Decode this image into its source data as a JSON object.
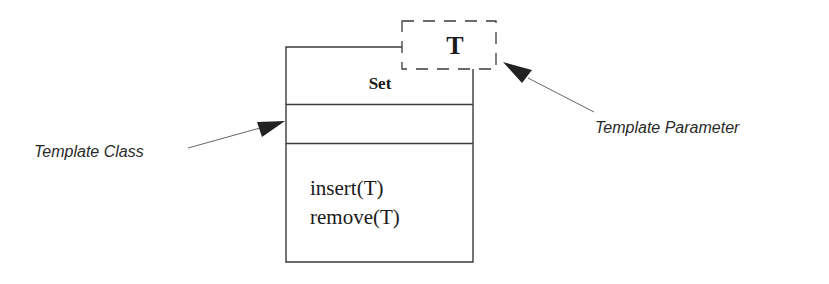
{
  "diagram": {
    "type": "uml-template-class",
    "class": {
      "name": "Set",
      "attributes": [],
      "operations": [
        "insert(T)",
        "remove(T)"
      ]
    },
    "template_parameter": "T",
    "annotations": {
      "template_class": "Template Class",
      "template_parameter": "Template Parameter"
    },
    "colors": {
      "line": "#3a3a3a",
      "arrow": "#222222",
      "text": "#1a1a1a"
    }
  }
}
